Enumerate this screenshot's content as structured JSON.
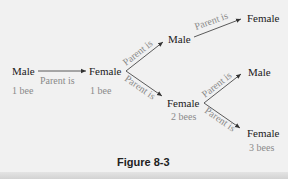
{
  "diagram": {
    "nodes": [
      {
        "id": "n1",
        "label": "Male",
        "count": "1 bee"
      },
      {
        "id": "n2",
        "label": "Female",
        "count": "1 bee"
      },
      {
        "id": "n3",
        "label": "Male"
      },
      {
        "id": "n4",
        "label": "Female",
        "count": "2 bees"
      },
      {
        "id": "n5",
        "label": "Female"
      },
      {
        "id": "n6",
        "label": "Male"
      },
      {
        "id": "n7",
        "label": "Female",
        "count": "3 bees"
      }
    ],
    "edge_label": "Parent is",
    "edges": [
      {
        "from": "n1",
        "to": "n2",
        "label": "Parent is"
      },
      {
        "from": "n2",
        "to": "n3",
        "label": "Parent is"
      },
      {
        "from": "n2",
        "to": "n4",
        "label": "Parent is"
      },
      {
        "from": "n3",
        "to": "n5",
        "label": "Parent is"
      },
      {
        "from": "n4",
        "to": "n6",
        "label": "Parent is"
      },
      {
        "from": "n4",
        "to": "n7",
        "label": "Parent is"
      }
    ],
    "caption": "Figure 8-3",
    "colors": {
      "background": "#f1f1f1",
      "node_text": "#1a1a1a",
      "label_text": "#8a8a8a",
      "arrow": "#333333"
    }
  }
}
